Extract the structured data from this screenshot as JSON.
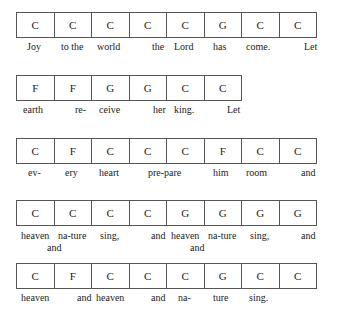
{
  "song": {
    "rows": [
      {
        "top": 12,
        "chords": [
          "C",
          "C",
          "C",
          "C",
          "C",
          "G",
          "C",
          "C"
        ],
        "lyrics": [
          {
            "text": "Joy",
            "x": 27,
            "y": 41
          },
          {
            "text": "to the",
            "x": 61,
            "y": 41
          },
          {
            "text": "world",
            "x": 97,
            "y": 41
          },
          {
            "text": "the",
            "x": 152,
            "y": 41
          },
          {
            "text": "Lord",
            "x": 174,
            "y": 41
          },
          {
            "text": "has",
            "x": 213,
            "y": 41
          },
          {
            "text": "come.",
            "x": 246,
            "y": 41
          },
          {
            "text": "Let",
            "x": 304,
            "y": 41
          }
        ]
      },
      {
        "top": 75,
        "chords": [
          "F",
          "F",
          "G",
          "G",
          "C",
          "C"
        ],
        "lyrics": [
          {
            "text": "earth",
            "x": 23,
            "y": 104
          },
          {
            "text": "re-",
            "x": 75,
            "y": 104
          },
          {
            "text": "ceive",
            "x": 99,
            "y": 104
          },
          {
            "text": "her",
            "x": 153,
            "y": 104
          },
          {
            "text": "king.",
            "x": 174,
            "y": 104
          },
          {
            "text": "Let",
            "x": 227,
            "y": 104
          }
        ]
      },
      {
        "top": 138,
        "chords": [
          "C",
          "F",
          "C",
          "C",
          "C",
          "F",
          "C",
          "C"
        ],
        "lyrics": [
          {
            "text": "ev-",
            "x": 28,
            "y": 167
          },
          {
            "text": "ery",
            "x": 65,
            "y": 167
          },
          {
            "text": "heart",
            "x": 99,
            "y": 167
          },
          {
            "text": "pre-pare",
            "x": 148,
            "y": 167
          },
          {
            "text": "him",
            "x": 213,
            "y": 167
          },
          {
            "text": "room",
            "x": 246,
            "y": 167
          },
          {
            "text": "and",
            "x": 301,
            "y": 167
          }
        ]
      },
      {
        "top": 200,
        "chords": [
          "C",
          "C",
          "C",
          "C",
          "G",
          "G",
          "G",
          "G"
        ],
        "lyrics": [
          {
            "text": "heaven",
            "x": 21,
            "y": 230
          },
          {
            "text": "na-ture",
            "x": 58,
            "y": 230
          },
          {
            "text": "sing,",
            "x": 100,
            "y": 230
          },
          {
            "text": "and",
            "x": 151,
            "y": 230
          },
          {
            "text": "heaven",
            "x": 171,
            "y": 230
          },
          {
            "text": "na-ture",
            "x": 208,
            "y": 230
          },
          {
            "text": "sing,",
            "x": 250,
            "y": 230
          },
          {
            "text": "and",
            "x": 301,
            "y": 230
          },
          {
            "text": "and",
            "x": 47,
            "y": 242
          },
          {
            "text": "and",
            "x": 190,
            "y": 242
          }
        ]
      },
      {
        "top": 263,
        "chords": [
          "C",
          "F",
          "C",
          "C",
          "C",
          "G",
          "C",
          "C"
        ],
        "lyrics": [
          {
            "text": "heaven",
            "x": 21,
            "y": 292
          },
          {
            "text": "and",
            "x": 77,
            "y": 292
          },
          {
            "text": "heaven",
            "x": 96,
            "y": 292
          },
          {
            "text": "and",
            "x": 151,
            "y": 292
          },
          {
            "text": "na-",
            "x": 178,
            "y": 292
          },
          {
            "text": "ture",
            "x": 213,
            "y": 292
          },
          {
            "text": "sing.",
            "x": 249,
            "y": 292
          }
        ]
      }
    ]
  }
}
